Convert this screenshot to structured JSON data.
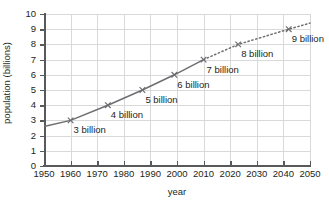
{
  "chart_data": {
    "type": "line",
    "title": "",
    "xlabel": "year",
    "ylabel": "population (billions)",
    "xlim": [
      1950,
      2050
    ],
    "ylim": [
      0,
      10
    ],
    "grid": true,
    "legend": "none",
    "xticks": [
      1950,
      1960,
      1970,
      1980,
      1990,
      2000,
      2010,
      2020,
      2030,
      2040,
      2050
    ],
    "yticks": [
      0,
      1,
      2,
      3,
      4,
      5,
      6,
      7,
      8,
      9,
      10
    ],
    "series": [
      {
        "name": "historical population",
        "style": "solid",
        "color": "#6d6e71",
        "x": [
          1950,
          1960,
          1974,
          1987,
          1999,
          2010
        ],
        "values": [
          2.6,
          3.0,
          4.0,
          5.0,
          6.0,
          7.0
        ]
      },
      {
        "name": "projected population",
        "style": "dotted",
        "color": "#6d6e71",
        "x": [
          2010,
          2023,
          2042,
          2050
        ],
        "values": [
          7.0,
          8.0,
          9.0,
          9.4
        ]
      }
    ],
    "markers": [
      {
        "label": "3 billion",
        "x": 1960,
        "y": 3.0
      },
      {
        "label": "4 billion",
        "x": 1974,
        "y": 4.0
      },
      {
        "label": "5 billion",
        "x": 1987,
        "y": 5.0
      },
      {
        "label": "6 billion",
        "x": 1999,
        "y": 6.0
      },
      {
        "label": "7 billion",
        "x": 2010,
        "y": 7.0
      },
      {
        "label": "8 billion",
        "x": 2023,
        "y": 8.0
      },
      {
        "label": "9 billion",
        "x": 2042,
        "y": 9.0
      }
    ],
    "annotations": [
      "3 billion",
      "4 billion",
      "5 billion",
      "6 billion",
      "7 billion",
      "8 billion",
      "9 billion"
    ]
  },
  "ytick_labels": [
    "0",
    "1",
    "2",
    "3",
    "4",
    "5",
    "6",
    "7",
    "8",
    "9",
    "10"
  ],
  "xtick_labels": [
    "1950",
    "1960",
    "1970",
    "1980",
    "1990",
    "2000",
    "2010",
    "2020",
    "2030",
    "2040",
    "2050"
  ],
  "colors": {
    "line": "#6d6e71",
    "grid": "#d9d9d9",
    "axis": "#58595b",
    "text": "#231f20",
    "background": "#ffffff"
  }
}
